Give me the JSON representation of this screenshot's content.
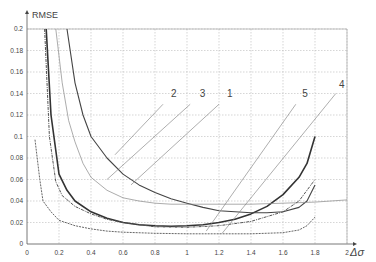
{
  "chart_data": {
    "type": "line",
    "title": "",
    "xlabel": "Δσ",
    "ylabel": "RMSE",
    "xlim": [
      0,
      2
    ],
    "ylim": [
      0,
      0.2
    ],
    "grid": true,
    "xticks": [
      "0",
      "0.2",
      "0.4",
      "0.6",
      "0.8",
      "1",
      "1.2",
      "1.4",
      "1.6",
      "1.8",
      "2"
    ],
    "yticks": [
      "0",
      "0.02",
      "0.04",
      "0.06",
      "0.08",
      "0.1",
      "0.12",
      "0.14",
      "0.16",
      "0.18",
      "0.2"
    ],
    "series": [
      {
        "name": "1",
        "style": "thick-solid",
        "color": "#333333",
        "x": [
          0.12,
          0.15,
          0.2,
          0.25,
          0.3,
          0.4,
          0.5,
          0.6,
          0.7,
          0.8,
          0.9,
          1.0,
          1.1,
          1.2,
          1.3,
          1.4,
          1.5,
          1.6,
          1.7,
          1.75,
          1.8
        ],
        "y": [
          0.2,
          0.12,
          0.065,
          0.05,
          0.04,
          0.03,
          0.024,
          0.02,
          0.018,
          0.017,
          0.0165,
          0.017,
          0.018,
          0.02,
          0.023,
          0.028,
          0.035,
          0.046,
          0.062,
          0.075,
          0.1
        ]
      },
      {
        "name": "2",
        "style": "solid",
        "color": "#444444",
        "x": [
          0.25,
          0.3,
          0.35,
          0.4,
          0.5,
          0.6,
          0.7,
          0.8,
          0.9,
          1.0,
          1.1,
          1.2,
          1.3,
          1.4,
          1.5,
          1.6,
          1.7,
          1.75,
          1.8
        ],
        "y": [
          0.2,
          0.15,
          0.12,
          0.1,
          0.08,
          0.065,
          0.055,
          0.048,
          0.042,
          0.038,
          0.034,
          0.031,
          0.03,
          0.029,
          0.029,
          0.03,
          0.034,
          0.04,
          0.055
        ]
      },
      {
        "name": "3",
        "style": "thin-solid",
        "color": "#888888",
        "x": [
          0.18,
          0.22,
          0.26,
          0.3,
          0.35,
          0.4,
          0.5,
          0.6,
          0.7,
          0.8,
          0.9,
          1.0,
          1.2,
          1.4,
          1.6,
          1.8,
          2.0
        ],
        "y": [
          0.2,
          0.15,
          0.115,
          0.095,
          0.075,
          0.062,
          0.05,
          0.043,
          0.04,
          0.038,
          0.037,
          0.037,
          0.037,
          0.037,
          0.038,
          0.039,
          0.041
        ]
      },
      {
        "name": "4",
        "style": "dashed",
        "color": "#555555",
        "x": [
          0.05,
          0.08,
          0.1,
          0.15,
          0.2,
          0.3,
          0.4,
          0.5,
          0.6,
          0.8,
          1.0,
          1.2,
          1.4,
          1.6,
          1.7,
          1.75,
          1.8
        ],
        "y": [
          0.097,
          0.06,
          0.04,
          0.03,
          0.022,
          0.017,
          0.014,
          0.012,
          0.011,
          0.01,
          0.0095,
          0.0095,
          0.0095,
          0.0105,
          0.013,
          0.017,
          0.025
        ]
      },
      {
        "name": "5",
        "style": "dash-dot",
        "color": "#555555",
        "x": [
          0.11,
          0.14,
          0.18,
          0.22,
          0.3,
          0.4,
          0.5,
          0.6,
          0.8,
          1.0,
          1.2,
          1.4,
          1.6,
          1.7,
          1.8
        ],
        "y": [
          0.2,
          0.1,
          0.058,
          0.045,
          0.035,
          0.028,
          0.023,
          0.02,
          0.016,
          0.0155,
          0.017,
          0.021,
          0.03,
          0.04,
          0.06
        ]
      }
    ],
    "annotations": [
      {
        "label": "2",
        "text_x": 0.9,
        "text_y": 0.137,
        "line_from": [
          0.85,
          0.13
        ],
        "line_to": [
          0.55,
          0.083
        ]
      },
      {
        "label": "3",
        "text_x": 1.08,
        "text_y": 0.137,
        "line_from": [
          1.02,
          0.13
        ],
        "line_to": [
          0.5,
          0.06
        ]
      },
      {
        "label": "1",
        "text_x": 1.25,
        "text_y": 0.137,
        "line_from": [
          1.2,
          0.13
        ],
        "line_to": [
          0.65,
          0.055
        ]
      },
      {
        "label": "5",
        "text_x": 1.72,
        "text_y": 0.137,
        "line_from": [
          1.68,
          0.13
        ],
        "line_to": [
          1.12,
          0.012
        ]
      },
      {
        "label": "4",
        "text_x": 1.95,
        "text_y": 0.145,
        "line_from": [
          1.93,
          0.14
        ],
        "line_to": [
          1.22,
          0.01
        ]
      }
    ]
  }
}
